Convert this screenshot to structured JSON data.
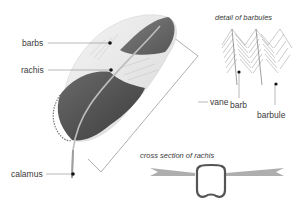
{
  "diagram": {
    "labels": {
      "barbs": "barbs",
      "rachis": "rachis",
      "vane": "vane",
      "calamus": "calamus",
      "barb": "barb",
      "barbule": "barbule"
    },
    "captions": {
      "barbules_detail": "detail of barbules",
      "cross_section": "cross section of rachis"
    },
    "colors": {
      "leader_line": "#8a8a8a",
      "dot": "#111111",
      "dark_vane": "#4a4a4a",
      "light_vane": "#e8e8e8",
      "rachis": "#bdbdbd"
    }
  }
}
